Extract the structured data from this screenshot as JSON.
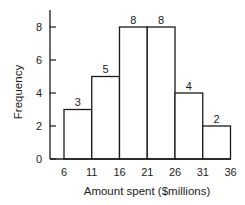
{
  "chart_data": {
    "type": "bar",
    "subtype": "histogram",
    "title": "",
    "xlabel": "Amount spent ($millions)",
    "ylabel": "Frequency",
    "bin_edges": [
      6,
      11,
      16,
      21,
      26,
      31,
      36
    ],
    "categories": [
      "6-11",
      "11-16",
      "16-21",
      "21-26",
      "26-31",
      "31-36"
    ],
    "values": [
      3,
      5,
      8,
      8,
      4,
      2
    ],
    "data_labels": [
      "3",
      "5",
      "8",
      "8",
      "4",
      "2"
    ],
    "x_ticks": [
      "6",
      "11",
      "16",
      "21",
      "26",
      "31",
      "36"
    ],
    "y_ticks": [
      "0",
      "2",
      "4",
      "6",
      "8"
    ],
    "ylim": [
      0,
      9
    ],
    "xlim": [
      6,
      36
    ],
    "grid": false,
    "legend": null,
    "bar_fill": "#ffffff",
    "bar_stroke": "#1a1a1a"
  }
}
